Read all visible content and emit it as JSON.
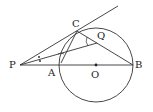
{
  "diagram": {
    "type": "geometry",
    "colors": {
      "stroke": "#333333",
      "background": "#ffffff"
    },
    "points": [
      {
        "id": "P",
        "label": "P",
        "x": 20,
        "y": 65
      },
      {
        "id": "A",
        "label": "A",
        "x": 59,
        "y": 65
      },
      {
        "id": "O",
        "label": "O",
        "x": 96,
        "y": 65
      },
      {
        "id": "B",
        "label": "B",
        "x": 133,
        "y": 65
      },
      {
        "id": "C",
        "label": "C",
        "x": 77,
        "y": 31
      },
      {
        "id": "Q",
        "label": "Q",
        "x": 97,
        "y": 43
      }
    ],
    "circle": {
      "center": "O",
      "radius": 37
    },
    "segments": [
      "P-B",
      "P-tangent-through-C",
      "P-Q",
      "C-B",
      "C-A"
    ],
    "angle_marks": [
      "equal angles at P (dots)",
      "angle at Q between QC and QP (arc)"
    ]
  }
}
